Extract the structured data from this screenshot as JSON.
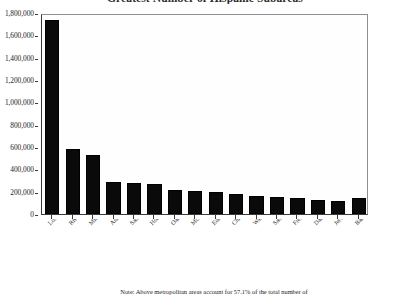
{
  "chart_data": {
    "type": "bar",
    "title": "Greatest Number of Hispanic Subareas",
    "xlabel": "",
    "ylabel": "",
    "ylim": [
      0,
      1800000
    ],
    "ytick_step": 200000,
    "grid": false,
    "legend": null,
    "note": "Note: Above metropolitan areas account for 57.1% of the total number of",
    "ytick_labels": [
      "1,800,000",
      "1,600,000",
      "1,400,000",
      "1,200,000",
      "1,000,000",
      "800,000",
      "600,000",
      "400,000",
      "200,000",
      "0"
    ],
    "categories": [
      "Los Angeles, Long Beach, Calif.",
      "Riverside, San Bernardino, Calif.",
      "Miami, Hialeah, Fla.",
      "Anaheim-Santa Ana, Calif.",
      "San Diego, Calif.",
      "Houston, Tex.",
      "Oakland, Calif.",
      "McAllen, Calif.",
      "Edinburg, Mission, Tex.",
      "Chicago, Ill.",
      "Washington, D.C. - Md. - Va.",
      "San Francisco, Calif.",
      "Fresno, Calif.",
      "Dallas, Tex.",
      "Jersey City, N.J.",
      "Bakersfield, Calif."
    ],
    "values": [
      1740000,
      580000,
      525000,
      290000,
      275000,
      265000,
      215000,
      205000,
      200000,
      175000,
      160000,
      150000,
      140000,
      125000,
      120000,
      140000
    ],
    "bar_color": "#0a0a0a"
  }
}
